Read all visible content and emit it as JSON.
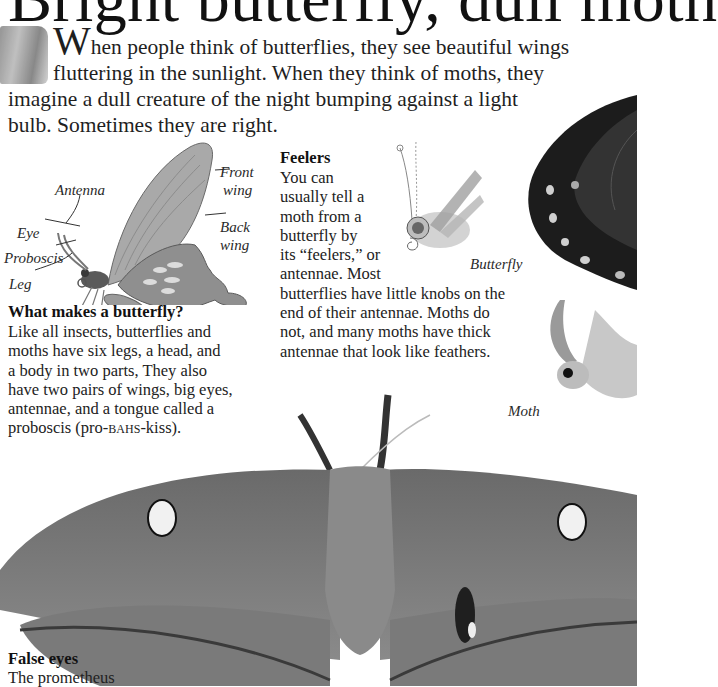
{
  "page": {
    "title": "Bright butterfly, dull moth",
    "intro": {
      "drop_cap": "W",
      "line1": "hen people think of butterflies, they see beautiful wings",
      "line2": "fluttering in the sunlight. When they think of moths, they",
      "line3": "imagine a dull creature of the night bumping against a light",
      "line4": "bulb. Sometimes they are right."
    },
    "diagram": {
      "labels": {
        "antenna": "Antenna",
        "eye": "Eye",
        "proboscis": "Proboscis",
        "leg": "Leg",
        "front_wing_1": "Front",
        "front_wing_2": "wing",
        "back_wing_1": "Back",
        "back_wing_2": "wing"
      }
    },
    "what_makes": {
      "heading": "What makes a butterfly?",
      "lines": [
        "Like all insects, butterflies and",
        "moths have six legs, a head, and",
        "a body in two parts, They also",
        "have two pairs of wings, big eyes,",
        "antennae, and a tongue called a"
      ],
      "last_line_pre": "proboscis (pro-",
      "last_line_sc": "bahs",
      "last_line_post": "-kiss)."
    },
    "feelers": {
      "heading": "Feelers",
      "narrow_lines": [
        "You can",
        "usually tell a",
        "moth from a",
        "butterfly by",
        "its “feelers,” or",
        "antennae. Most"
      ],
      "wide_lines": [
        "butterflies have little knobs on the",
        "end of their antennae. Moths do",
        "not, and many moths have thick",
        "antennae that look like feathers."
      ],
      "caption_butterfly": "Butterfly",
      "caption_moth": "Moth"
    },
    "false_eyes": {
      "heading": "False eyes",
      "line1": "The prometheus"
    }
  }
}
